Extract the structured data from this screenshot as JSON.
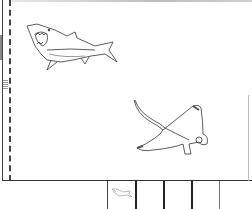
{
  "canvas": {
    "drawings": [
      {
        "name": "shark",
        "icon": "shark-drawing"
      },
      {
        "name": "manta-ray",
        "icon": "manta-ray-drawing"
      }
    ],
    "line_color": "#333333",
    "background": "#ffffff"
  },
  "page_strip": {
    "slots": [
      {
        "index": 1,
        "thumbnail": "shark-thumbnail"
      },
      {
        "index": 2,
        "thumbnail": ""
      },
      {
        "index": 3,
        "thumbnail": ""
      },
      {
        "index": 4,
        "thumbnail": ""
      },
      {
        "index": 5,
        "thumbnail": ""
      }
    ]
  }
}
